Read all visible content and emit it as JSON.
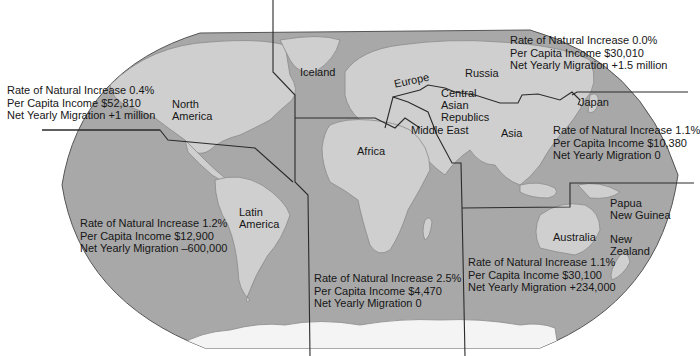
{
  "map": {
    "ocean_color": "#a6a6a6",
    "land_color": "#d2d2d2",
    "boundary_color": "#2b2b2b",
    "region_labels": {
      "iceland": "Iceland",
      "europe": "Europe",
      "russia": "Russia",
      "north_america_1": "North",
      "north_america_2": "America",
      "central_asian_1": "Central",
      "central_asian_2": "Asian",
      "central_asian_3": "Republics",
      "middle_east": "Middle East",
      "asia": "Asia",
      "japan": "Japan",
      "africa": "Africa",
      "latin_america_1": "Latin",
      "latin_america_2": "America",
      "papua_1": "Papua",
      "papua_2": "New Guinea",
      "australia": "Australia",
      "new_zealand_1": "New",
      "new_zealand_2": "Zealand"
    },
    "stats": {
      "north_america": {
        "natural_increase": "Rate of Natural Increase 0.4%",
        "income": "Per Capita Income $52,810",
        "migration": "Net Yearly Migration +1 million"
      },
      "russia": {
        "natural_increase": "Rate of Natural Increase 0.0%",
        "income": "Per Capita Income $30,010",
        "migration": "Net Yearly Migration +1.5 million"
      },
      "asia": {
        "natural_increase": "Rate of Natural Increase 1.1%",
        "income": "Per Capita Income $10,380",
        "migration": "Net Yearly Migration 0"
      },
      "latin_america": {
        "natural_increase": "Rate of Natural Increase 1.2%",
        "income": "Per Capita Income $12,900",
        "migration": "Net Yearly Migration –600,000"
      },
      "africa": {
        "natural_increase": "Rate of Natural Increase 2.5%",
        "income": "Per Capita Income $4,470",
        "migration": "Net Yearly Migration 0"
      },
      "oceania": {
        "natural_increase": "Rate of Natural Increase 1.1%",
        "income": "Per Capita Income $30,100",
        "migration": "Net Yearly Migration +234,000"
      }
    }
  }
}
